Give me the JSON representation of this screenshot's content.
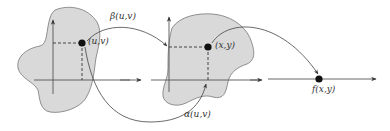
{
  "diagram": {
    "colors": {
      "background": "#ffffff",
      "region_fill": "#d9d9d9",
      "stroke": "#555555",
      "point": "#111111"
    },
    "panels": [
      {
        "id": "domain-uv",
        "kind": "2d-region",
        "point_label": "(u,v)"
      },
      {
        "id": "domain-xy",
        "kind": "2d-region",
        "point_label": "(x,y)"
      },
      {
        "id": "codomain",
        "kind": "1d-line",
        "point_label": "f(x,y)"
      }
    ],
    "maps": [
      {
        "id": "beta",
        "label": "β(u,v)",
        "from": "(u,v)",
        "to": "y-axis of second panel"
      },
      {
        "id": "alpha",
        "label": "α(u,v)",
        "from": "(u,v)",
        "to": "x-axis of second panel"
      },
      {
        "id": "f",
        "label": "",
        "from": "(x,y)",
        "to": "f(x,y)"
      }
    ],
    "labels": {
      "uv": "(u,v)",
      "xy": "(x,y)",
      "fxy": "f(x,y)",
      "beta": "β(u,v)",
      "alpha": "α(u,v)"
    }
  }
}
